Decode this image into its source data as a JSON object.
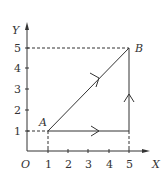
{
  "diagram": {
    "axes": {
      "x_label": "X",
      "y_label": "Y",
      "origin_label": "O"
    },
    "x_ticks": [
      "1",
      "2",
      "3",
      "4",
      "5"
    ],
    "y_ticks": [
      "1",
      "2",
      "3",
      "4",
      "5"
    ],
    "points": [
      {
        "name": "A",
        "x": 1,
        "y": 1
      },
      {
        "name": "B",
        "x": 5,
        "y": 5
      }
    ],
    "paths": [
      {
        "name": "direct",
        "from": "A",
        "to": "B",
        "description": "straight line A to B"
      },
      {
        "name": "horizontal",
        "from": [
          1,
          1
        ],
        "to": [
          5,
          1
        ]
      },
      {
        "name": "vertical",
        "from": [
          5,
          1
        ],
        "to": [
          5,
          5
        ]
      }
    ],
    "colors": {
      "line": "#333333",
      "background": "#ffffff"
    }
  }
}
